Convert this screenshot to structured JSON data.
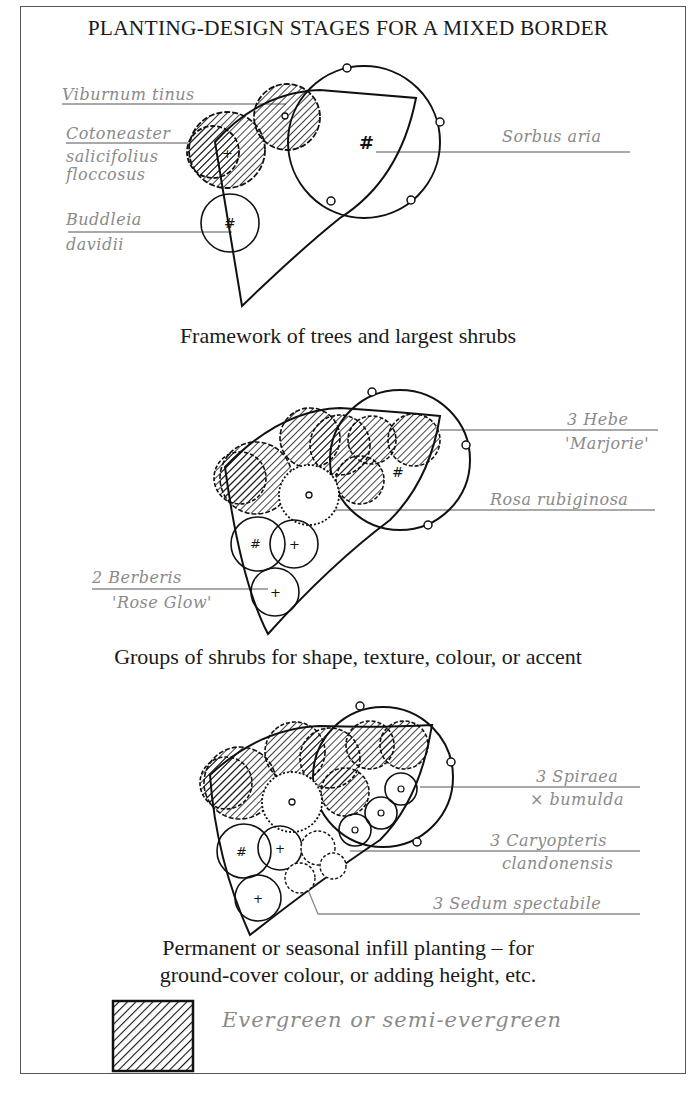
{
  "title": "PLANTING-DESIGN STAGES FOR A MIXED BORDER",
  "stages": [
    {
      "caption": "Framework of trees and largest shrubs",
      "labels": {
        "viburnum": "Viburnum tinus",
        "cotoneaster_1": "Cotoneaster",
        "cotoneaster_2": "salicifolius",
        "cotoneaster_3": "floccosus",
        "buddleia_1": "Buddleia",
        "buddleia_2": "davidii",
        "sorbus": "Sorbus aria"
      }
    },
    {
      "caption": "Groups of shrubs for shape, texture, colour, or accent",
      "labels": {
        "hebe_1": "3 Hebe",
        "hebe_2": "'Marjorie'",
        "rosa": "Rosa rubiginosa",
        "berberis_1": "2 Berberis",
        "berberis_2": "'Rose Glow'"
      }
    },
    {
      "caption_line1": "Permanent or seasonal infill planting – for",
      "caption_line2": "ground-cover colour, or adding height, etc.",
      "labels": {
        "spiraea_1": "3 Spiraea",
        "spiraea_2": "× bumulda",
        "caryopteris_1": "3 Caryopteris",
        "caryopteris_2": "clandonensis",
        "sedum": "3 Sedum spectabile"
      }
    }
  ],
  "legend": {
    "swatch": "hatched-square",
    "label": "Evergreen or semi-evergreen"
  },
  "colors": {
    "ink": "#111111",
    "label_grey": "#8a8a8a",
    "frame": "#555555",
    "background": "#ffffff"
  }
}
